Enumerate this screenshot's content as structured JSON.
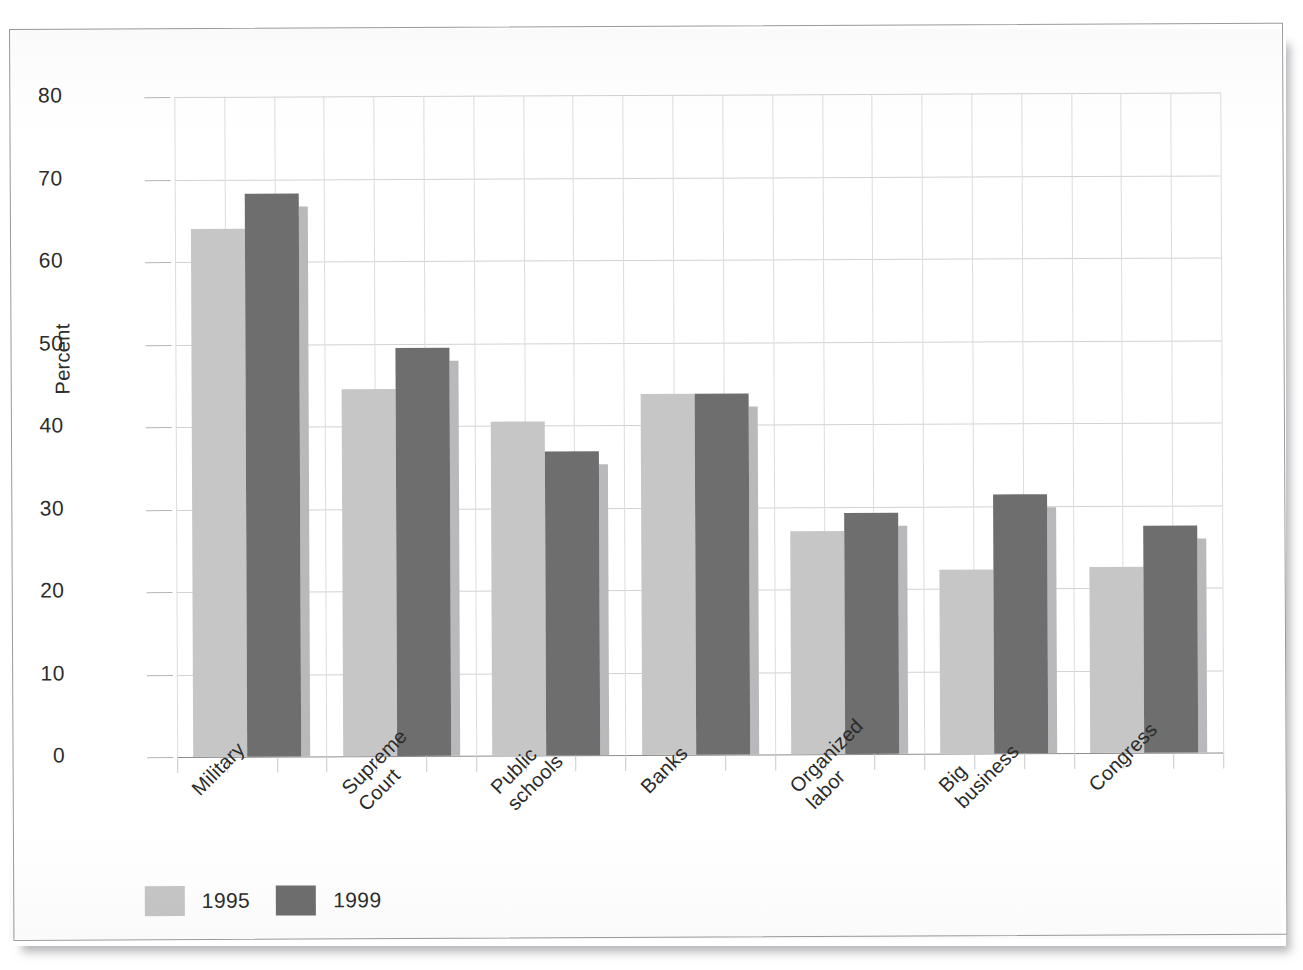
{
  "chart_data": {
    "type": "bar",
    "title": "",
    "subtitle": "",
    "xlabel": "",
    "ylabel": "Percent",
    "ylim": [
      0,
      80
    ],
    "yticks": [
      0,
      10,
      20,
      30,
      40,
      50,
      60,
      70,
      80
    ],
    "ytick_labels": [
      "0",
      "10",
      "20",
      "30",
      "40",
      "50",
      "60",
      "70",
      "80"
    ],
    "grid": "both",
    "legend_position": "bottom-left",
    "categories": [
      "Military",
      "Supreme Court",
      "Public schools",
      "Banks",
      "Organized labor",
      "Big business",
      "Congress"
    ],
    "category_label_lines": [
      [
        "Military"
      ],
      [
        "Supreme",
        "Court"
      ],
      [
        "Public",
        "schools"
      ],
      [
        "Banks"
      ],
      [
        "Organized",
        "labor"
      ],
      [
        "Big",
        "business"
      ],
      [
        "Congress"
      ]
    ],
    "series": [
      {
        "name": "1995",
        "color": "#c6c6c6",
        "values": [
          64.0,
          44.5,
          40.5,
          43.8,
          27.0,
          22.3,
          22.5
        ]
      },
      {
        "name": "1999",
        "color": "#6e6e6e",
        "values": [
          68.2,
          49.5,
          36.8,
          43.8,
          29.2,
          31.4,
          27.5
        ]
      }
    ]
  },
  "legend": {
    "items": [
      {
        "label": "1995",
        "color": "#c6c6c6"
      },
      {
        "label": "1999",
        "color": "#6e6e6e"
      }
    ]
  },
  "axis": {
    "y_title": "Percent"
  },
  "colors": {
    "series_1995": "#c6c6c6",
    "series_1999": "#6e6e6e",
    "gridline": "#dcdcde",
    "baseline": "#8d8d91",
    "text": "#2c2c2c",
    "frame": "#9a9a9f",
    "background": "#ffffff"
  }
}
